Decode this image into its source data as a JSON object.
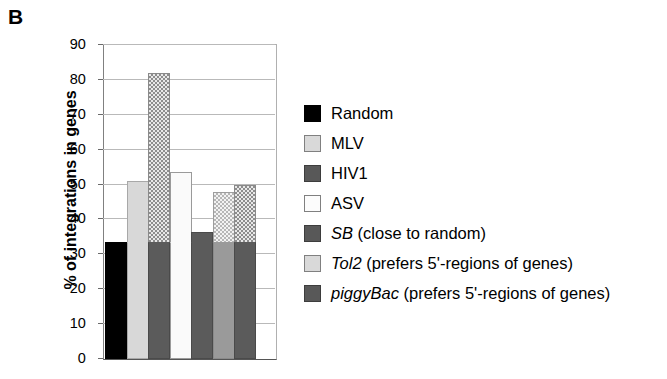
{
  "panel": {
    "label": "B"
  },
  "chart_data": {
    "type": "bar",
    "title": "",
    "subtitle": "",
    "xlabel": "",
    "ylabel": "% of integrations in genes",
    "ylim": [
      0,
      90
    ],
    "ytick_step": 10,
    "yticks": [
      "90",
      "80",
      "70",
      "60",
      "50",
      "40",
      "30",
      "20",
      "10",
      "0"
    ],
    "ytick_values": [
      90,
      80,
      70,
      60,
      50,
      40,
      30,
      20,
      10,
      0
    ],
    "grid": true,
    "xtick_labels": [],
    "legend_position": "right",
    "categories": [
      "Random",
      "MLV",
      "HIV1",
      "ASV",
      "SB",
      "Tol2",
      "piggyBac"
    ],
    "values": [
      33.5,
      51,
      82,
      53.5,
      36.5,
      48,
      50
    ],
    "series": [
      {
        "name": "% of integrations in genes",
        "values": [
          33.5,
          51,
          82,
          53.5,
          36.5,
          48,
          50
        ]
      }
    ],
    "bar_styles": [
      "solid-black",
      "solid-light-gray",
      "checkered-dark",
      "solid-white",
      "solid-dark-gray",
      "checkered-light",
      "checkered-dark"
    ],
    "colors": {
      "black": "#000000",
      "light_gray": "#d8d8d8",
      "dark_gray": "#5b5b5b",
      "white": "#fafafa",
      "medium_gray": "#9a9a9a",
      "gridline": "#b9b9b9",
      "axis": "#555555"
    }
  },
  "legend": {
    "items": [
      {
        "label": "Random",
        "name_italic": "",
        "suffix": "",
        "swatch": "black"
      },
      {
        "label": "MLV",
        "name_italic": "",
        "suffix": "",
        "swatch": "ltgray"
      },
      {
        "label": "HIV1",
        "name_italic": "",
        "suffix": "",
        "swatch": "dkgray"
      },
      {
        "label": "ASV",
        "name_italic": "",
        "suffix": "",
        "swatch": "white"
      },
      {
        "label": "SB (close to random)",
        "name_italic": "SB",
        "suffix": " (close to random)",
        "swatch": "dkgray"
      },
      {
        "label": "Tol2 (prefers 5'-regions of genes)",
        "name_italic": "Tol2",
        "suffix": " (prefers 5'-regions of genes)",
        "swatch": "ltgray"
      },
      {
        "label": "piggyBac (prefers 5'-regions of genes)",
        "name_italic": "piggyBac",
        "suffix": " (prefers 5'-regions of genes)",
        "swatch": "dkgray"
      }
    ]
  }
}
